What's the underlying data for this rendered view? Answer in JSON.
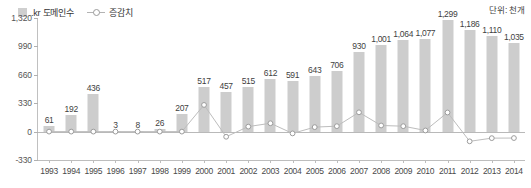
{
  "unit_note": "단위: 천개",
  "legend": {
    "bar_label": ".kr 도메인수",
    "line_label": "증감치"
  },
  "chart_data": {
    "type": "bar",
    "title": "",
    "subtitle": "",
    "xlabel": "",
    "ylabel": "",
    "unit": "단위: 천개",
    "grid": false,
    "legend_position": "top-left",
    "ylim": [
      -330,
      1320
    ],
    "yticks": [
      -330,
      0,
      330,
      660,
      990,
      1320
    ],
    "ytick_labels": [
      "-330",
      "0",
      "330",
      "660",
      "990",
      "1,320"
    ],
    "categories": [
      "1993",
      "1994",
      "1995",
      "1996",
      "1997",
      "1998",
      "1999",
      "2000",
      "2001",
      "2002",
      "2003",
      "2004",
      "2005",
      "2006",
      "2007",
      "2008",
      "2009",
      "2010",
      "2011",
      "2012",
      "2013",
      "2014"
    ],
    "series": [
      {
        "name": ".kr 도메인수",
        "type": "bar",
        "values": [
          61,
          192,
          436,
          3,
          8,
          26,
          207,
          517,
          457,
          515,
          612,
          591,
          643,
          706,
          930,
          1001,
          1064,
          1077,
          1299,
          1186,
          1110,
          1035
        ],
        "labels": [
          "61",
          "192",
          "436",
          "3",
          "8",
          "26",
          "207",
          "517",
          "457",
          "515",
          "612",
          "591",
          "643",
          "706",
          "930",
          "1,001",
          "1,064",
          "1,077",
          "1,299",
          "1,186",
          "1,110",
          "1,035"
        ]
      },
      {
        "name": "증감치",
        "type": "line",
        "values": [
          0,
          0,
          0,
          0,
          0,
          0,
          0,
          310,
          -60,
          58,
          97,
          -21,
          52,
          63,
          224,
          71,
          63,
          13,
          222,
          -113,
          -76,
          -75
        ]
      }
    ]
  }
}
